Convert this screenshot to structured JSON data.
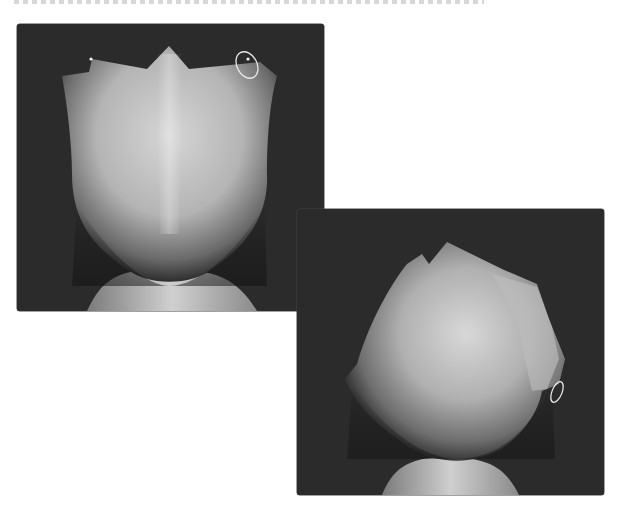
{
  "page": {
    "caption_cropped": true
  },
  "colors": {
    "viewport_bg": "#2b2b2b",
    "mesh_light": "#d8d8d8",
    "mesh_mid": "#a9a9a9",
    "mesh_dark": "#2a2a2a",
    "highlight_ellipse": "#e8e8e8"
  },
  "viewports": [
    {
      "id": "front",
      "view": "front",
      "annotation": "highlight-ellipse-top-right-vertex",
      "selected_vertices": 2
    },
    {
      "id": "angle",
      "view": "three-quarter-top",
      "annotation": "highlight-ellipse-right-side"
    }
  ]
}
